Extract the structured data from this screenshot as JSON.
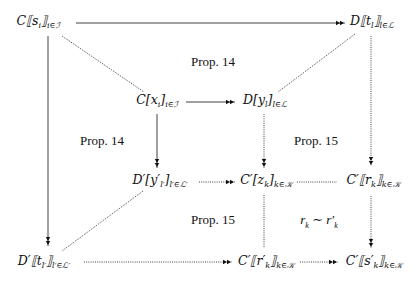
{
  "diagram": {
    "nodes": [
      {
        "id": "n1",
        "main": "C⟦s",
        "sub_i": "i",
        "close": "⟧",
        "index": "i∈ℐ",
        "x": 35,
        "y": 20
      },
      {
        "id": "n2",
        "main": "D⟦t",
        "sub_i": "l",
        "close": "⟧",
        "index": "l∈ℒ",
        "x": 368,
        "y": 20
      },
      {
        "id": "n3",
        "main": "C[x",
        "sub_i": "i",
        "close": "]",
        "index": "i∈ℐ",
        "x": 155,
        "y": 101
      },
      {
        "id": "n4",
        "main": "D[y",
        "sub_i": "l",
        "close": "]",
        "index": "l∈ℒ",
        "x": 260,
        "y": 101
      },
      {
        "id": "n5",
        "main": "D′[y′",
        "sub_i": "l′",
        "close": "]",
        "index": "l′∈ℒ′",
        "x": 157,
        "y": 181
      },
      {
        "id": "n6",
        "main": "C′[z",
        "sub_i": "k",
        "close": "]",
        "index": "k∈𝒦",
        "x": 265,
        "y": 181
      },
      {
        "id": "n7",
        "main": "C′⟦r",
        "sub_i": "k",
        "close": "⟧",
        "index": "k∈𝒦",
        "x": 370,
        "y": 181
      },
      {
        "id": "n8",
        "main": "D′⟦t",
        "sub_i": "l′",
        "close": "⟧",
        "index": "l′∈ℒ′",
        "x": 40,
        "y": 262
      },
      {
        "id": "n9",
        "main": "C′⟦r′",
        "sub_i": "k",
        "close": "⟧",
        "index": "k∈𝒦",
        "x": 263,
        "y": 262
      },
      {
        "id": "n10",
        "main": "C′⟦s′",
        "sub_i": "k",
        "close": "⟧",
        "index": "k∈𝒦",
        "x": 372,
        "y": 262
      }
    ],
    "labels": [
      {
        "text": "Prop. 14",
        "x": 213,
        "y": 62
      },
      {
        "text": "Prop. 14",
        "x": 102,
        "y": 141
      },
      {
        "text": "Prop. 15",
        "x": 316,
        "y": 141
      },
      {
        "text": "Prop. 15",
        "x": 213,
        "y": 220
      },
      {
        "text": "r_k ∼ r′_k",
        "x": 319,
        "y": 220
      }
    ],
    "relation": {
      "left": "r",
      "left_sub": "k",
      "op": " ∼ ",
      "right": "r′",
      "right_sub": "k"
    }
  }
}
